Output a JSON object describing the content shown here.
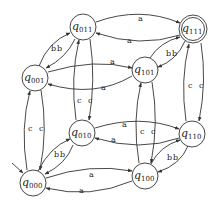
{
  "diagram": {
    "type": "finite-automaton",
    "initial_state": "q000",
    "accepting_states": [
      "q111"
    ],
    "states": [
      {
        "id": "q000",
        "base": "q",
        "sub": "000",
        "x": 33,
        "y": 183,
        "accepting": false,
        "initial": true
      },
      {
        "id": "q001",
        "base": "q",
        "sub": "001",
        "x": 35,
        "y": 78,
        "accepting": false,
        "initial": false
      },
      {
        "id": "q010",
        "base": "q",
        "sub": "010",
        "x": 82,
        "y": 133,
        "accepting": false,
        "initial": false
      },
      {
        "id": "q011",
        "base": "q",
        "sub": "011",
        "x": 83,
        "y": 27,
        "accepting": false,
        "initial": false
      },
      {
        "id": "q100",
        "base": "q",
        "sub": "100",
        "x": 145,
        "y": 176,
        "accepting": false,
        "initial": false
      },
      {
        "id": "q101",
        "base": "q",
        "sub": "101",
        "x": 145,
        "y": 70,
        "accepting": false,
        "initial": false
      },
      {
        "id": "q110",
        "base": "q",
        "sub": "110",
        "x": 192,
        "y": 134,
        "accepting": false,
        "initial": false
      },
      {
        "id": "q111",
        "base": "q",
        "sub": "111",
        "x": 193,
        "y": 29,
        "accepting": true,
        "initial": false
      }
    ],
    "transitions": [
      {
        "from": "q000",
        "to": "q100",
        "label": "a"
      },
      {
        "from": "q100",
        "to": "q000",
        "label": "a"
      },
      {
        "from": "q001",
        "to": "q101",
        "label": "a"
      },
      {
        "from": "q101",
        "to": "q001",
        "label": "a"
      },
      {
        "from": "q010",
        "to": "q110",
        "label": "a"
      },
      {
        "from": "q110",
        "to": "q010",
        "label": "a"
      },
      {
        "from": "q011",
        "to": "q111",
        "label": "a"
      },
      {
        "from": "q111",
        "to": "q011",
        "label": "a"
      },
      {
        "from": "q000",
        "to": "q010",
        "label": "b"
      },
      {
        "from": "q010",
        "to": "q000",
        "label": "b"
      },
      {
        "from": "q001",
        "to": "q011",
        "label": "b"
      },
      {
        "from": "q011",
        "to": "q001",
        "label": "b"
      },
      {
        "from": "q100",
        "to": "q110",
        "label": "b"
      },
      {
        "from": "q110",
        "to": "q100",
        "label": "b"
      },
      {
        "from": "q101",
        "to": "q111",
        "label": "b"
      },
      {
        "from": "q111",
        "to": "q101",
        "label": "b"
      },
      {
        "from": "q000",
        "to": "q001",
        "label": "c"
      },
      {
        "from": "q001",
        "to": "q000",
        "label": "c"
      },
      {
        "from": "q010",
        "to": "q011",
        "label": "c"
      },
      {
        "from": "q011",
        "to": "q010",
        "label": "c"
      },
      {
        "from": "q100",
        "to": "q101",
        "label": "c"
      },
      {
        "from": "q101",
        "to": "q100",
        "label": "c"
      },
      {
        "from": "q110",
        "to": "q111",
        "label": "c"
      },
      {
        "from": "q111",
        "to": "q110",
        "label": "c"
      }
    ],
    "labels": {
      "a": "a",
      "b": "b",
      "c": "c"
    }
  }
}
